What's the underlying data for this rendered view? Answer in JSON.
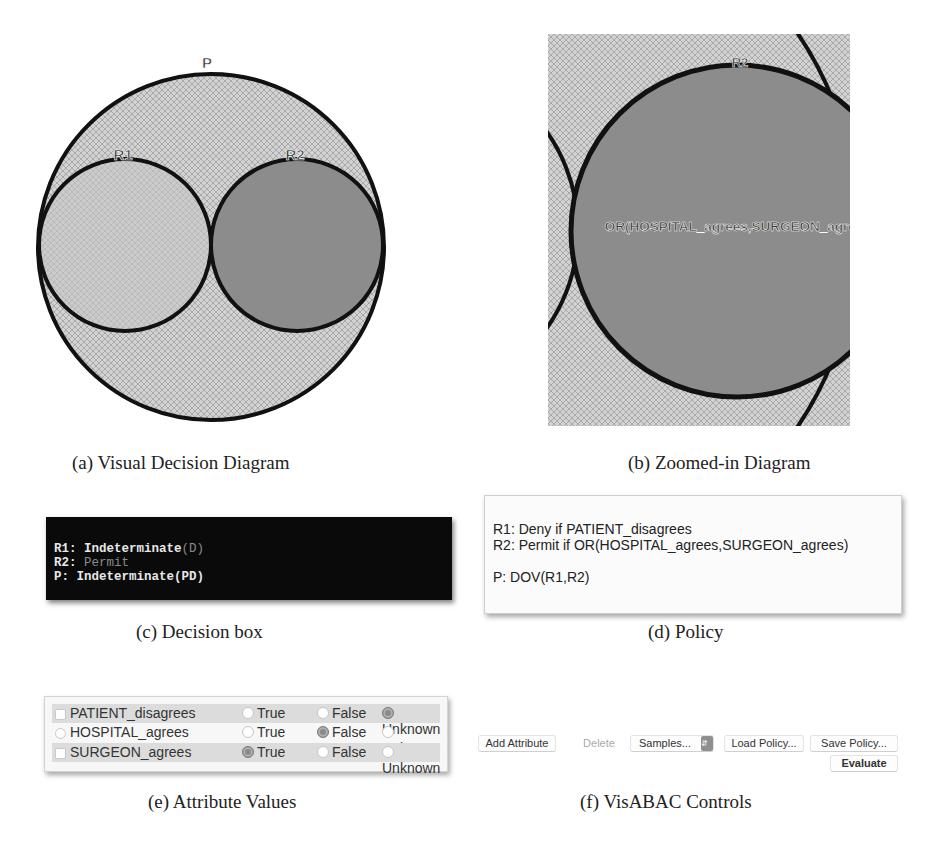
{
  "panels": {
    "a": {
      "caption": "(a) Visual Decision Diagram",
      "labels": {
        "policy": "P",
        "rule1": "R1",
        "rule2": "R2"
      },
      "colors": {
        "hatch_bg": "#cfcfcf",
        "hatch_line": "#a8a8a8",
        "r1_fill": "#c9c9c9",
        "r2_fill": "#8c8c8c",
        "stroke": "#111111"
      }
    },
    "b": {
      "caption": "(b) Zoomed-in Diagram",
      "labels": {
        "rule2": "R2",
        "condition": "OR(HOSPITAL_agrees,SURGEON_agrees)"
      }
    },
    "c": {
      "caption": "(c) Decision box",
      "lines": [
        {
          "key": "R1:",
          "value": "Indeterminate",
          "suffix": "(D)"
        },
        {
          "key": "R2:",
          "value": "Permit",
          "suffix": ""
        },
        {
          "key": "P:",
          "value": "Indeterminate(PD)",
          "suffix": ""
        }
      ]
    },
    "d": {
      "caption": "(d) Policy",
      "lines": [
        "R1: Deny if PATIENT_disagrees",
        "R2: Permit if OR(HOSPITAL_agrees,SURGEON_agrees)",
        "",
        "P: DOV(R1,R2)"
      ]
    },
    "e": {
      "caption": "(e) Attribute Values",
      "option_labels": [
        "True",
        "False",
        "Unknown"
      ],
      "rows": [
        {
          "name": "PATIENT_disagrees",
          "selected": "Unknown"
        },
        {
          "name": "HOSPITAL_agrees",
          "selected": "False"
        },
        {
          "name": "SURGEON_agrees",
          "selected": "True"
        }
      ]
    },
    "f": {
      "caption": "(f) VisABAC Controls",
      "buttons": {
        "add_attribute": "Add Attribute",
        "delete": "Delete",
        "samples": "Samples...",
        "load_policy": "Load Policy...",
        "save_policy": "Save Policy...",
        "evaluate": "Evaluate"
      }
    }
  }
}
